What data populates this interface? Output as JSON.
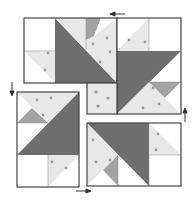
{
  "diagram": {
    "type": "quilt-block-assembly",
    "colors": {
      "dark": "#6e6e6e",
      "medium": "#a3a3a3",
      "print": "#e8e8e8",
      "background": "#ffffff",
      "outline": "#444444"
    },
    "units": [
      {
        "id": "top-unit",
        "position": "top"
      },
      {
        "id": "right-unit",
        "position": "right"
      },
      {
        "id": "bottom-unit",
        "position": "bottom"
      },
      {
        "id": "left-unit",
        "position": "left"
      },
      {
        "id": "center-square",
        "position": "center"
      }
    ],
    "arrows": [
      {
        "id": "top-arrow",
        "direction": "left"
      },
      {
        "id": "right-arrow",
        "direction": "up"
      },
      {
        "id": "bottom-arrow",
        "direction": "right"
      },
      {
        "id": "left-arrow",
        "direction": "down"
      }
    ]
  }
}
